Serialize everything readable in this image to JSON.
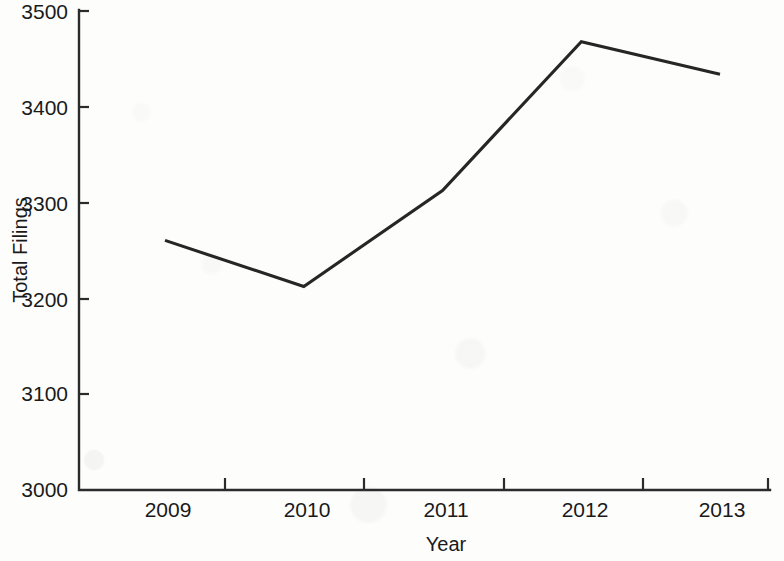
{
  "chart_data": {
    "type": "line",
    "title": "",
    "xlabel": "Year",
    "ylabel": "Total Filings",
    "categories": [
      "2009",
      "2010",
      "2011",
      "2012",
      "2013"
    ],
    "values": [
      3260,
      3212,
      3312,
      3467,
      3433
    ],
    "series": [
      {
        "name": "Total Filings",
        "values": [
          3260,
          3212,
          3312,
          3467,
          3433
        ]
      }
    ],
    "x": [
      2009,
      2010,
      2011,
      2012,
      2013
    ],
    "ylim": [
      3000,
      3500
    ],
    "xlim": [
      2008.55,
      2013.55
    ],
    "y_ticks": [
      "3000",
      "3100",
      "3200",
      "3300",
      "3400",
      "3500"
    ],
    "y_tick_values": [
      3000,
      3100,
      3200,
      3300,
      3400,
      3500
    ],
    "x_ticks": [
      "2009",
      "2010",
      "2011",
      "2012",
      "2013"
    ],
    "grid": false,
    "legend": false,
    "legend_position": "none",
    "line_color": "#262626",
    "axis_color": "#2b2b2b",
    "background_color": "#fdfdfc",
    "markers": false
  },
  "axes": {
    "y_axis_title": "Total Filings",
    "x_axis_title": "Year",
    "y_labels": {
      "t0": "3000",
      "t1": "3100",
      "t2": "3200",
      "t3": "3300",
      "t4": "3400",
      "t5": "3500"
    },
    "x_labels": {
      "c0": "2009",
      "c1": "2010",
      "c2": "2011",
      "c3": "2012",
      "c4": "2013"
    }
  }
}
